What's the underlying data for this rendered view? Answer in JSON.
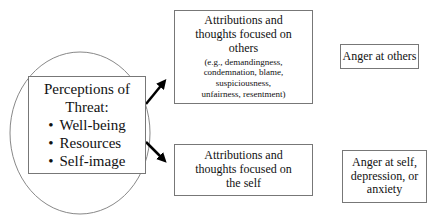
{
  "diagram": {
    "source_node": {
      "title": "Perceptions of Threat:",
      "title_line1": "Perceptions of",
      "title_line2": "Threat:",
      "items": [
        "Well-being",
        "Resources",
        "Self-image"
      ]
    },
    "other_focus_node": {
      "line1": "Attributions and",
      "line2": "thoughts focused on",
      "line3": "others",
      "examples_line1": "(e.g., demandingness,",
      "examples_line2": "condemnation, blame,",
      "examples_line3": "suspiciousness,",
      "examples_line4": "unfairness, resentment)"
    },
    "self_focus_node": {
      "line1": "Attributions and",
      "line2": "thoughts focused on",
      "line3": "the self"
    },
    "outcome_others": {
      "label": "Anger at others"
    },
    "outcome_self": {
      "line1": "Anger at self,",
      "line2": "depression, or",
      "line3": "anxiety"
    },
    "edges": [
      {
        "from": "Perceptions of Threat",
        "to": "Attributions and thoughts focused on others"
      },
      {
        "from": "Perceptions of Threat",
        "to": "Attributions and thoughts focused on the self"
      },
      {
        "from": "Attributions and thoughts focused on others",
        "to": "Anger at others"
      },
      {
        "from": "Attributions and thoughts focused on the self",
        "to": "Anger at self, depression, or anxiety"
      }
    ]
  }
}
